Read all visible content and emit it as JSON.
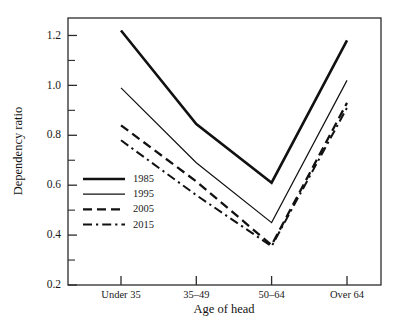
{
  "chart_data": {
    "type": "line",
    "title": "",
    "xlabel": "Age of head",
    "ylabel": "Dependency ratio",
    "categories": [
      "Under 35",
      "35–49",
      "50–64",
      "Over 64"
    ],
    "ylim": [
      0.2,
      1.27
    ],
    "yticks": [
      0.2,
      0.4,
      0.6,
      0.8,
      1.0,
      1.2
    ],
    "ytick_labels": [
      "0.2",
      "0.4",
      "0.6",
      "0.8",
      "1.0",
      "1.2"
    ],
    "yticks_minor": [
      0.3,
      0.5,
      0.7,
      0.9,
      1.1
    ],
    "grid": false,
    "legend_position": "inside-left-lower",
    "series": [
      {
        "name": "1985",
        "style": "solid",
        "width": 2.6,
        "color": "#111111",
        "values": [
          1.22,
          0.845,
          0.61,
          1.18
        ]
      },
      {
        "name": "1995",
        "style": "solid",
        "width": 1.2,
        "color": "#111111",
        "values": [
          0.99,
          0.69,
          0.45,
          1.02
        ]
      },
      {
        "name": "2005",
        "style": "dashed",
        "width": 2.3,
        "color": "#111111",
        "values": [
          0.84,
          0.615,
          0.36,
          0.93
        ]
      },
      {
        "name": "2015",
        "style": "dashdot",
        "width": 2.0,
        "color": "#111111",
        "values": [
          0.78,
          0.56,
          0.355,
          0.91
        ]
      }
    ]
  }
}
